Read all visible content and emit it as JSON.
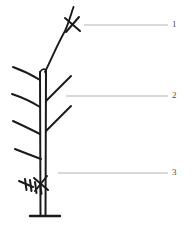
{
  "figure": {
    "type": "botanical-line-drawing",
    "background_color": "#ffffff",
    "ink_color": "#1a1a1a",
    "leader_line_color": "#b3b3b3",
    "label_text_color": "#4a4a4a"
  },
  "labels": [
    {
      "id": "label-1",
      "number": "1",
      "target": "leading-shoot-tip-with-pruning-cut",
      "leader_line": {
        "x1": 84,
        "y1": 25,
        "x2": 168,
        "y2": 25
      },
      "text_x": 172,
      "text_y": 20
    },
    {
      "id": "label-2",
      "number": "2",
      "target": "lateral-branch",
      "leader_line": {
        "x1": 66,
        "y1": 96,
        "x2": 168,
        "y2": 96
      },
      "text_x": 172,
      "text_y": 91
    },
    {
      "id": "label-3",
      "number": "3",
      "target": "basal-buds-on-trunk",
      "leader_line": {
        "x1": 58,
        "y1": 173,
        "x2": 168,
        "y2": 173
      },
      "text_x": 172,
      "text_y": 168
    }
  ],
  "plant_geometry": {
    "trunk": {
      "left_edge": "M 40 72 L 40.5 216",
      "right_edge": "M 46 70 L 45.5 216",
      "top_cap": "M 40 72 Q 43 68 46 70"
    },
    "ground_line": {
      "x1": 30,
      "y1": 216,
      "x2": 60,
      "y2": 216
    },
    "leader_shoot": "M 45 72 C 52 58 58 44 66 30 C 70 22 72 14 74 8",
    "tip_cross_mark": [
      "M 66 18 L 80 30",
      "M 79 17 L 67 31"
    ],
    "left_branches": [
      "M 40 80 C 32 76 24 72 14 68",
      "M 40 106 C 32 102 24 98 13 94",
      "M 40 133 C 32 130 24 126 14 122",
      "M 41 158 C 33 156 25 153 16 150"
    ],
    "right_branches": [
      "M 46 100 C 54 92 62 84 71 76",
      "M 46 130 C 54 122 62 114 71 106"
    ],
    "bud_marks": [
      "M 34 178 L 48 190",
      "M 47 177 L 35 191",
      "M 20 182 L 33 187",
      "M 26 180 L 27 190",
      "M 31 181 L 32 191",
      "M 36 183 L 37 193",
      "M 41 184 L 42 194"
    ]
  }
}
